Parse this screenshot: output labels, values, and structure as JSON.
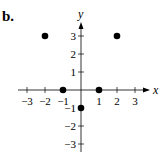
{
  "figure_label": "b.",
  "chart_data": {
    "type": "scatter",
    "title": "",
    "xlabel": "x",
    "ylabel": "y",
    "xlim": [
      -3.5,
      3.5
    ],
    "ylim": [
      -3.5,
      3.5
    ],
    "xticks": [
      -3,
      -2,
      -1,
      1,
      2,
      3
    ],
    "yticks": [
      3,
      2,
      1,
      -1,
      -2,
      -3
    ],
    "grid": false,
    "points": [
      {
        "x": -2,
        "y": 3
      },
      {
        "x": 2,
        "y": 3
      },
      {
        "x": -1,
        "y": 0
      },
      {
        "x": 1,
        "y": 0
      },
      {
        "x": 0,
        "y": -1
      }
    ]
  }
}
